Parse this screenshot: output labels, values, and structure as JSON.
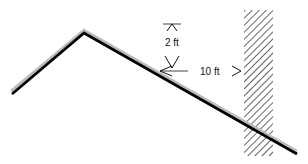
{
  "diagram": {
    "labels": {
      "vertical_dimension": "2 ft",
      "horizontal_dimension": "10 ft"
    },
    "colors": {
      "line": "#000000",
      "hatch": "#222222",
      "background": "#ffffff"
    }
  }
}
